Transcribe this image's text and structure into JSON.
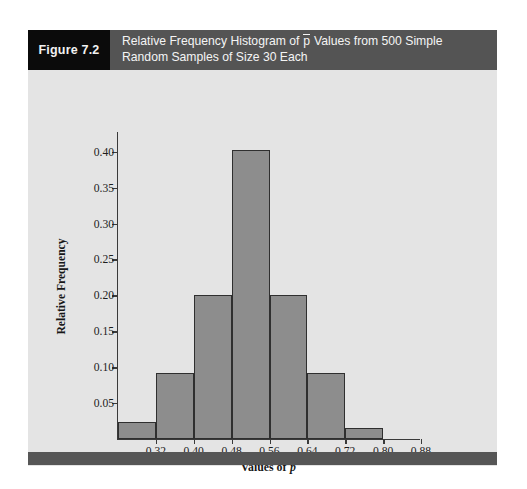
{
  "figure": {
    "number_label": "Figure 7.2",
    "caption_line1_before": "Relative Frequency Histogram of ",
    "caption_line1_pbar": "p",
    "caption_line1_after": " Values from 500 Simple",
    "caption_line2": "Random Samples of Size 30 Each"
  },
  "colors": {
    "panel_background": "#e4e4e4",
    "figure_number_background": "#0b0b0b",
    "caption_band_background": "#545454",
    "bar_fill": "#8d8d8d",
    "bar_border": "#2f2f2f",
    "axis": "#3a3a3a",
    "bottom_bar": "#565656",
    "text_light": "#f4f4f4",
    "text_dark": "#1d1d1d"
  },
  "axes": {
    "y_title": "Relative Frequency",
    "x_title_before": "Values of ",
    "x_title_var": "p"
  },
  "chart_data": {
    "type": "bar",
    "subtitle": "",
    "xlabel": "Values of p̄",
    "ylabel": "Relative Frequency",
    "grid": false,
    "legend_position": "none",
    "histogram": true,
    "bin_width": 0.08,
    "bin_edges": [
      0.24,
      0.32,
      0.4,
      0.48,
      0.56,
      0.64,
      0.72,
      0.8,
      0.88
    ],
    "categories": [
      "0.24-0.32",
      "0.32-0.40",
      "0.40-0.48",
      "0.48-0.56",
      "0.56-0.64",
      "0.64-0.72",
      "0.72-0.80",
      "0.80-0.88"
    ],
    "values": [
      0.024,
      0.092,
      0.2,
      0.402,
      0.2,
      0.092,
      0.015,
      0.0
    ],
    "x_ticks": [
      "0.32",
      "0.40",
      "0.48",
      "0.56",
      "0.64",
      "0.72",
      "0.80",
      "0.88"
    ],
    "x_tick_values": [
      0.32,
      0.4,
      0.48,
      0.56,
      0.64,
      0.72,
      0.8,
      0.88
    ],
    "xlim": [
      0.24,
      0.88
    ],
    "y_ticks": [
      "0.05",
      "0.10",
      "0.15",
      "0.20",
      "0.25",
      "0.30",
      "0.35",
      "0.40"
    ],
    "y_tick_values": [
      0.05,
      0.1,
      0.15,
      0.2,
      0.25,
      0.3,
      0.35,
      0.4
    ],
    "ylim": [
      0,
      0.4275
    ]
  }
}
